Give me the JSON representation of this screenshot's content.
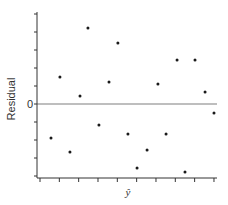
{
  "chart_data": {
    "type": "scatter",
    "title": "",
    "xlabel": "ŷ",
    "ylabel": "Residual",
    "xlim": [
      -0.15,
      9.15
    ],
    "ylim": [
      -4.3,
      5.1
    ],
    "x_ticks": [
      0,
      1,
      2,
      3,
      4,
      5,
      6,
      7,
      8,
      9
    ],
    "y_ticks": [
      -4,
      -3,
      -2,
      -1,
      0,
      1,
      2,
      3,
      4,
      5
    ],
    "y_tick_labels": [
      {
        "value": 0,
        "label": "0"
      }
    ],
    "reference_line": {
      "y": 0,
      "color": "#a8a8a8"
    },
    "grid": false,
    "legend": "none",
    "points": [
      {
        "x": 0.57,
        "y": -1.89
      },
      {
        "x": 1.03,
        "y": 1.5
      },
      {
        "x": 1.55,
        "y": -2.67
      },
      {
        "x": 2.07,
        "y": 0.44
      },
      {
        "x": 2.48,
        "y": 4.22
      },
      {
        "x": 3.05,
        "y": -1.17
      },
      {
        "x": 3.57,
        "y": 1.22
      },
      {
        "x": 4.03,
        "y": 3.39
      },
      {
        "x": 4.55,
        "y": -1.67
      },
      {
        "x": 5.02,
        "y": -3.56
      },
      {
        "x": 5.54,
        "y": -2.56
      },
      {
        "x": 6.1,
        "y": 1.11
      },
      {
        "x": 6.52,
        "y": -1.67
      },
      {
        "x": 7.09,
        "y": 2.44
      },
      {
        "x": 7.5,
        "y": -3.78
      },
      {
        "x": 8.02,
        "y": 2.44
      },
      {
        "x": 8.54,
        "y": 0.67
      },
      {
        "x": 9.0,
        "y": -0.5
      }
    ],
    "colors": {
      "axis": "#333333",
      "points": "#1a1a1a",
      "zero_line": "#a8a8a8"
    }
  }
}
